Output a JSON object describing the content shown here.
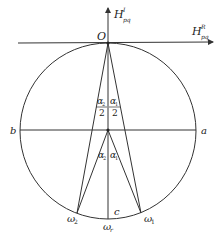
{
  "diagram": {
    "colors": {
      "stroke": "#333333",
      "text": "#222222",
      "background": "#ffffff"
    },
    "axes": {
      "vertical": {
        "label": "H",
        "superscript": "I",
        "subscript": "pq"
      },
      "horizontal": {
        "label": "H",
        "superscript": "R",
        "subscript": "pq"
      }
    },
    "points": {
      "origin": "O",
      "a": "a",
      "b": "b",
      "c": "c",
      "omega1": {
        "base": "ω",
        "sub": "1"
      },
      "omega2": {
        "base": "ω",
        "sub": "2"
      },
      "omega_r": {
        "base": "ω",
        "sub": "r"
      }
    },
    "angles": {
      "upper_left": {
        "num": "α",
        "num_sub": "2",
        "den": "2"
      },
      "upper_right": {
        "num": "α",
        "num_sub": "1",
        "den": "2"
      },
      "lower_left": {
        "base": "α",
        "sub": "2"
      },
      "lower_right": {
        "base": "α",
        "sub": "1"
      }
    }
  }
}
